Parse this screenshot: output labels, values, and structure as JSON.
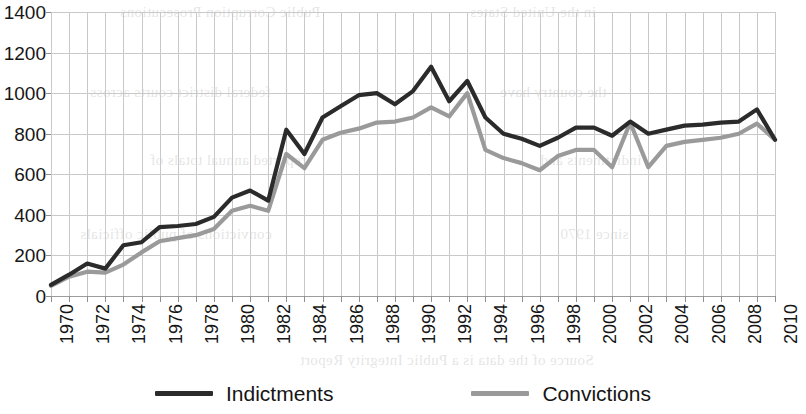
{
  "chart_data": {
    "type": "line",
    "title": "",
    "xlabel": "",
    "ylabel": "",
    "xlim": [
      1970,
      2010
    ],
    "ylim": [
      0,
      1400
    ],
    "grid": true,
    "legend_position": "bottom",
    "y_ticks": [
      0,
      200,
      400,
      600,
      800,
      1000,
      1200,
      1400
    ],
    "x_ticks": [
      1970,
      1972,
      1974,
      1976,
      1978,
      1980,
      1982,
      1984,
      1986,
      1988,
      1990,
      1992,
      1994,
      1996,
      1998,
      2000,
      2002,
      2004,
      2006,
      2008,
      2010
    ],
    "x": [
      1970,
      1971,
      1972,
      1973,
      1974,
      1975,
      1976,
      1977,
      1978,
      1979,
      1980,
      1981,
      1982,
      1983,
      1984,
      1985,
      1986,
      1987,
      1988,
      1989,
      1990,
      1991,
      1992,
      1993,
      1994,
      1995,
      1996,
      1997,
      1998,
      1999,
      2000,
      2001,
      2002,
      2003,
      2004,
      2005,
      2006,
      2007,
      2008,
      2009,
      2010
    ],
    "series": [
      {
        "name": "Indictments",
        "color": "#2b2b2b",
        "values": [
          55,
          105,
          160,
          135,
          250,
          265,
          340,
          345,
          355,
          390,
          485,
          520,
          470,
          820,
          700,
          880,
          935,
          990,
          1000,
          945,
          1010,
          1130,
          960,
          1060,
          880,
          800,
          775,
          740,
          780,
          830,
          830,
          790,
          860,
          800,
          820,
          840,
          845,
          855,
          860,
          920,
          770
        ]
      },
      {
        "name": "Convictions",
        "color": "#9a9a9a",
        "values": [
          50,
          95,
          120,
          115,
          155,
          215,
          270,
          285,
          300,
          330,
          420,
          445,
          420,
          700,
          630,
          770,
          805,
          825,
          855,
          860,
          880,
          930,
          885,
          1000,
          720,
          680,
          655,
          620,
          690,
          720,
          720,
          635,
          855,
          635,
          740,
          760,
          770,
          780,
          800,
          850,
          770
        ]
      }
    ]
  },
  "legend": {
    "items": [
      {
        "label": "Indictments",
        "color": "#2b2b2b"
      },
      {
        "label": "Convictions",
        "color": "#9a9a9a"
      }
    ]
  },
  "bleed_text": [
    {
      "text": "Public Corruption Prosecutions",
      "x": 120,
      "y": 4
    },
    {
      "text": "in the United States",
      "x": 470,
      "y": 4
    },
    {
      "text": "federal district courts across",
      "x": 90,
      "y": 84
    },
    {
      "text": "the country have",
      "x": 500,
      "y": 84
    },
    {
      "text": "reported annual totals of",
      "x": 150,
      "y": 152
    },
    {
      "text": "indictments and",
      "x": 540,
      "y": 152
    },
    {
      "text": "convictions of public officials",
      "x": 80,
      "y": 226
    },
    {
      "text": "since 1970",
      "x": 560,
      "y": 226
    },
    {
      "text": "Source of the data is a Public Integrity Report",
      "x": 300,
      "y": 352
    }
  ]
}
